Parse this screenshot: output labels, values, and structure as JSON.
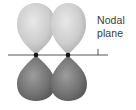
{
  "diagram": {
    "label_line1": "Nodal",
    "label_line2": "plane",
    "colors": {
      "upper_lobe": "#c8c8c8",
      "upper_lobe_highlight": "#e6e6e6",
      "lower_lobe": "#6e6e6e",
      "lower_lobe_highlight": "#9a9a9a",
      "nodal_line": "#555555",
      "nucleus": "#111111",
      "label": "#3a3a3a"
    },
    "nuclei": [
      {
        "x": 36,
        "y": 55
      },
      {
        "x": 68,
        "y": 55
      }
    ]
  }
}
